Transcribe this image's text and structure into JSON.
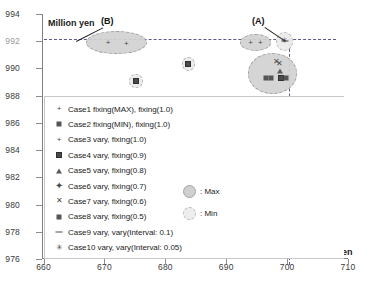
{
  "chart_data": {
    "type": "scatter",
    "title": "",
    "xlabel": "Million yen",
    "ylabel": "Million yen",
    "xlim": [
      660,
      710
    ],
    "ylim": [
      976,
      994
    ],
    "xticks": [
      660,
      670,
      680,
      690,
      700,
      710
    ],
    "yticks": [
      976,
      978,
      980,
      982,
      984,
      986,
      988,
      990,
      992,
      994
    ],
    "grid": false,
    "legend_position": "inside-lower-left",
    "reference_lines": [
      {
        "orientation": "horizontal",
        "value": 992,
        "style": "dashed"
      },
      {
        "orientation": "vertical",
        "value": 700,
        "style": "dashed"
      }
    ],
    "annotations": [
      {
        "text": "(A)",
        "x": 699.0,
        "y": 993.0
      },
      {
        "text": "(B)",
        "x": 673.5,
        "y": 993.1
      }
    ],
    "clusters": [
      {
        "label": "(B)",
        "kind": "Max",
        "cx": 672.0,
        "cy": 991.9,
        "rx": 5.0,
        "ry": 0.85
      },
      {
        "label": "(A)",
        "kind": "Max",
        "cx": 694.8,
        "cy": 991.9,
        "rx": 2.6,
        "ry": 0.62
      },
      {
        "label": "(A)",
        "kind": "Min",
        "cx": 699.6,
        "cy": 992.0,
        "rx": 1.4,
        "ry": 0.7
      },
      {
        "label": "(A)",
        "kind": "Max",
        "cx": 697.6,
        "cy": 989.6,
        "rx": 4.1,
        "ry": 1.5
      },
      {
        "label": "",
        "kind": "Min",
        "cx": 683.8,
        "cy": 990.3,
        "rx": 1.1,
        "ry": 0.52
      },
      {
        "label": "",
        "kind": "Min",
        "cx": 675.2,
        "cy": 989.1,
        "rx": 1.1,
        "ry": 0.52
      },
      {
        "label": "",
        "kind": "Max",
        "cx": 699.3,
        "cy": 980.3,
        "rx": 1.9,
        "ry": 2.1
      }
    ],
    "series": [
      {
        "name": "Case1 fixing(MAX), fixing(1.0)",
        "marker": "plus-thin",
        "points": [
          [
            670.6,
            991.9
          ],
          [
            673.6,
            991.8
          ]
        ]
      },
      {
        "name": "Case2 fixing(MIN), fixing(1.0)",
        "marker": "square-small",
        "points": [
          [
            696.6,
            989.3
          ],
          [
            697.4,
            989.3
          ]
        ]
      },
      {
        "name": "Case3 vary, fixing(1.0)",
        "marker": "plus-thin",
        "points": [
          [
            694.0,
            991.9
          ],
          [
            695.6,
            991.9
          ]
        ]
      },
      {
        "name": "Case4 vary, fixing(0.9)",
        "marker": "square-large",
        "points": [
          [
            683.8,
            990.3
          ],
          [
            675.2,
            989.1
          ],
          [
            699.0,
            989.3
          ]
        ]
      },
      {
        "name": "Case5 vary, fixing(0.8)",
        "marker": "triangle",
        "points": [
          [
            698.9,
            989.8
          ]
        ]
      },
      {
        "name": "Case6 vary, fixing(0.7)",
        "marker": "plus-bold",
        "points": [
          [
            698.4,
            981.4
          ],
          [
            699.6,
            978.5
          ]
        ]
      },
      {
        "name": "Case7 vary, fixing(0.6)",
        "marker": "cross-x",
        "points": [
          [
            698.3,
            990.5
          ],
          [
            698.7,
            990.3
          ]
        ]
      },
      {
        "name": "Case8 vary, fixing(0.5)",
        "marker": "square-small",
        "points": [
          [
            699.8,
            989.3
          ]
        ]
      },
      {
        "name": "Case9 vary, vary(Interval: 0.1)",
        "marker": "dash",
        "points": [
          [
            699.7,
            992.0
          ]
        ]
      },
      {
        "name": "Case10 vary, vary(Interval: 0.05)",
        "marker": "asterisk",
        "points": [
          [
            699.5,
            992.0
          ]
        ]
      }
    ]
  },
  "axes": {
    "y_caption": "Million yen",
    "x_caption": "Million yen",
    "x_tick_labels": [
      "660",
      "670",
      "680",
      "690",
      "700",
      "710"
    ],
    "y_tick_labels": [
      "994",
      "992",
      "990",
      "988",
      "986",
      "984",
      "982",
      "980",
      "978",
      "976"
    ]
  },
  "legend": {
    "items": [
      {
        "marker": "plus-thin",
        "label": "Case1 fixing(MAX), fixing(1.0)"
      },
      {
        "marker": "square-small",
        "label": "Case2 fixing(MIN), fixing(1.0)"
      },
      {
        "marker": "plus-thin",
        "label": "Case3 vary, fixing(1.0)"
      },
      {
        "marker": "square-large",
        "label": "Case4 vary, fixing(0.9)"
      },
      {
        "marker": "triangle",
        "label": "Case5 vary, fixing(0.8)"
      },
      {
        "marker": "plus-bold",
        "label": "Case6 vary, fixing(0.7)"
      },
      {
        "marker": "cross-x",
        "label": "Case7 vary, fixing(0.6)"
      },
      {
        "marker": "square-small",
        "label": "Case8 vary, fixing(0.5)"
      },
      {
        "marker": "dash",
        "label": "Case9 vary, vary(Interval: 0.1)"
      },
      {
        "marker": "asterisk",
        "label": "Case10 vary, vary(Interval: 0.05)"
      }
    ],
    "keys": [
      {
        "swatch": "max",
        "label": ": Max"
      },
      {
        "swatch": "min",
        "label": ": Min"
      }
    ]
  },
  "callouts": [
    {
      "name": "callout-a",
      "text": "(A)"
    },
    {
      "name": "callout-b",
      "text": "(B)"
    }
  ],
  "colors": {
    "axis": "#808080",
    "reference_line": "#5a5a8c",
    "max_fill": "#d2d2d2",
    "min_fill": "#ebebeb",
    "marker": "#4a4a4a",
    "text": "#1b1b1b"
  }
}
